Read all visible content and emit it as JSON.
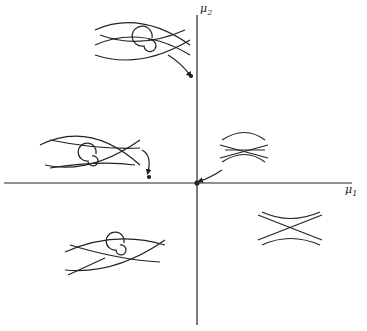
{
  "diagram": {
    "type": "bifurcation-diagram",
    "axes": {
      "horizontal": {
        "label": "μ",
        "subscript": "1"
      },
      "vertical": {
        "label": "μ",
        "subscript": "2"
      }
    },
    "phase_portraits": [
      {
        "id": "top-left-quadrant",
        "description": "two saddles with spiral focus between, heteroclinic-like connections, arrow to point on μ2 axis"
      },
      {
        "id": "left-on-axis",
        "description": "two saddles with spiral focus, arrow to point near μ1 axis"
      },
      {
        "id": "right-upper-near-axis",
        "description": "merging saddle-node structure, arrow to origin"
      },
      {
        "id": "bottom-right-quadrant",
        "description": "single saddle with hyperbolic flows"
      },
      {
        "id": "bottom-left-quadrant",
        "description": "two saddles with spiral focus"
      }
    ],
    "colors": {
      "ink": "#222222",
      "background": "#ffffff"
    }
  }
}
